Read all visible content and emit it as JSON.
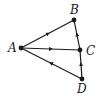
{
  "diagram": {
    "type": "directed-graph",
    "nodes": [
      {
        "id": "A",
        "label": "A",
        "x": 21,
        "y": 48
      },
      {
        "id": "B",
        "label": "B",
        "x": 74,
        "y": 20
      },
      {
        "id": "C",
        "label": "C",
        "x": 80,
        "y": 50
      },
      {
        "id": "D",
        "label": "D",
        "x": 82,
        "y": 79
      }
    ],
    "edges": [
      {
        "from": "A",
        "to": "B"
      },
      {
        "from": "A",
        "to": "C"
      },
      {
        "from": "D",
        "to": "A"
      },
      {
        "from": "C",
        "to": "B"
      },
      {
        "from": "D",
        "to": "C"
      }
    ],
    "colors": {
      "line": "#1a1a1a",
      "background": "#ffffff"
    }
  }
}
